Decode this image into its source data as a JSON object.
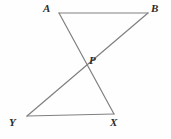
{
  "figure": {
    "type": "geometry-diagram",
    "background_color": "#fefefe",
    "stroke_color": "#808080",
    "label_color": "#2b2b2b",
    "stroke_width": 1.2,
    "width": 171,
    "height": 139,
    "points": [
      {
        "name": "A",
        "label": "A",
        "x": 59,
        "y": 13,
        "label_x": 43,
        "label_y": 3
      },
      {
        "name": "B",
        "label": "B",
        "x": 148,
        "y": 13,
        "label_x": 151,
        "label_y": 3
      },
      {
        "name": "P",
        "label": "P",
        "x": 83,
        "y": 60,
        "label_x": 89,
        "label_y": 55
      },
      {
        "name": "Y",
        "label": "Y",
        "x": 27,
        "y": 116,
        "label_x": 9,
        "label_y": 117
      },
      {
        "name": "X",
        "label": "X",
        "x": 114,
        "y": 114,
        "label_x": 110,
        "label_y": 117
      }
    ],
    "segments": [
      {
        "name": "segment-AB",
        "from": "A",
        "to": "B",
        "x1": 59,
        "y1": 13,
        "x2": 148,
        "y2": 13
      },
      {
        "name": "segment-AX",
        "from": "A",
        "to": "X",
        "x1": 59,
        "y1": 13,
        "x2": 114,
        "y2": 114
      },
      {
        "name": "segment-YB",
        "from": "Y",
        "to": "B",
        "x1": 27,
        "y1": 116,
        "x2": 148,
        "y2": 13
      },
      {
        "name": "segment-YX",
        "from": "Y",
        "to": "X",
        "x1": 27,
        "y1": 116,
        "x2": 114,
        "y2": 114
      }
    ]
  }
}
